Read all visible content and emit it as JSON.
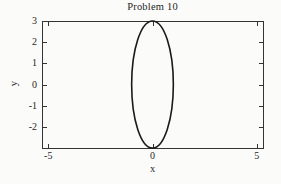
{
  "chart_data": {
    "type": "line",
    "title": "Problem 10",
    "xlabel": "x",
    "ylabel": "y",
    "xlim": [
      -5.3,
      5.3
    ],
    "ylim": [
      -3,
      3
    ],
    "x_ticks": [
      -5,
      0,
      5
    ],
    "x_tick_labels": [
      "-5",
      "0",
      "5"
    ],
    "y_ticks": [
      3,
      2,
      1,
      0,
      -1,
      -2
    ],
    "y_tick_labels": [
      "3",
      "2",
      "1",
      "0",
      "-1",
      "-2"
    ],
    "grid": false,
    "legend": "none",
    "frame_style": "closed box with inward tick marks on all four sides",
    "colors": {
      "curve": "#1a1a1a",
      "frame": "#333333",
      "background": "#fbfbf9",
      "text": "#1f1f1f"
    },
    "series": [
      {
        "name": "ellipse-curve",
        "shape": "ellipse",
        "center_x": 0,
        "center_y": 0,
        "semi_axis_x": 1,
        "semi_axis_y": 3,
        "equation": "x^2 + (y/3)^2 = 1",
        "line_style": "solid",
        "color": "#1a1a1a"
      }
    ]
  }
}
